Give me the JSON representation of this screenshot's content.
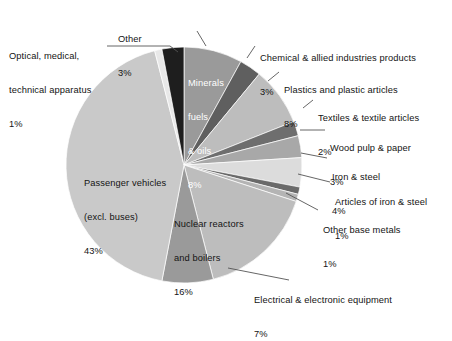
{
  "chart_data": {
    "type": "pie",
    "title": "",
    "subtitle": "",
    "units": "percent",
    "legend_position": "callout-labels",
    "total_labeled": 97,
    "categories": [
      "Minerals fuels & oils",
      "Chemical & allied industries products",
      "Plastics and plastic articles",
      "Textiles & textile articles",
      "Wood pulp & paper",
      "Iron & steel",
      "Articles of iron & steel",
      "Other base metals",
      "Nuclear reactors and boilers",
      "Electrical & electronic equipment",
      "Passenger vehicles (excl. buses)",
      "Optical, medical, technical apparatus",
      "Other"
    ],
    "values": [
      8,
      3,
      8,
      2,
      3,
      4,
      1,
      1,
      16,
      7,
      43,
      1,
      3
    ],
    "slice_colors": [
      "#9a9a9a",
      "#5f5f5f",
      "#bdbdbd",
      "#6e6e6e",
      "#a8a8a8",
      "#dcdcdc",
      "#6a6a6a",
      "#b4b4b4",
      "#bdbdbd",
      "#9a9a9a",
      "#c9c9c9",
      "#e8e8e8",
      "#1e1e1e"
    ]
  },
  "labels": {
    "other": {
      "name": "Other",
      "pct": "3%"
    },
    "optical": {
      "line1": "Optical, medical,",
      "line2": "technical apparatus",
      "pct": "1%"
    },
    "chemical": {
      "name": "Chemical & allied industries products",
      "pct": "3%"
    },
    "plastics": {
      "name": "Plastics and plastic articles",
      "pct": "8%"
    },
    "textiles": {
      "name": "Textiles & textile articles",
      "pct": "2%"
    },
    "woodpulp": {
      "name": "Wood pulp & paper",
      "pct": "3%"
    },
    "ironsteel": {
      "name": "Iron & steel",
      "pct": "4%"
    },
    "articles": {
      "name": "Articles of iron & steel",
      "pct": "1%"
    },
    "basemetals": {
      "name": "Other base metals",
      "pct": "1%"
    },
    "electrical": {
      "name": "Electrical & electronic equipment",
      "pct": "7%"
    },
    "minerals": {
      "line1": "Minerals",
      "line2": "fuels",
      "line3": "& oils",
      "pct": "8%"
    },
    "passenger": {
      "line1": "Passenger vehicles",
      "line2": "(excl. buses)",
      "pct": "43%"
    },
    "nuclear": {
      "line1": "Nuclear reactors",
      "line2": "and boilers",
      "pct": "16%"
    }
  },
  "colors": {
    "leader_line": "#555555",
    "slice_outline": "#ffffff",
    "text": "#141414",
    "inner_text_light": "#ffffff",
    "background": "#ffffff"
  }
}
